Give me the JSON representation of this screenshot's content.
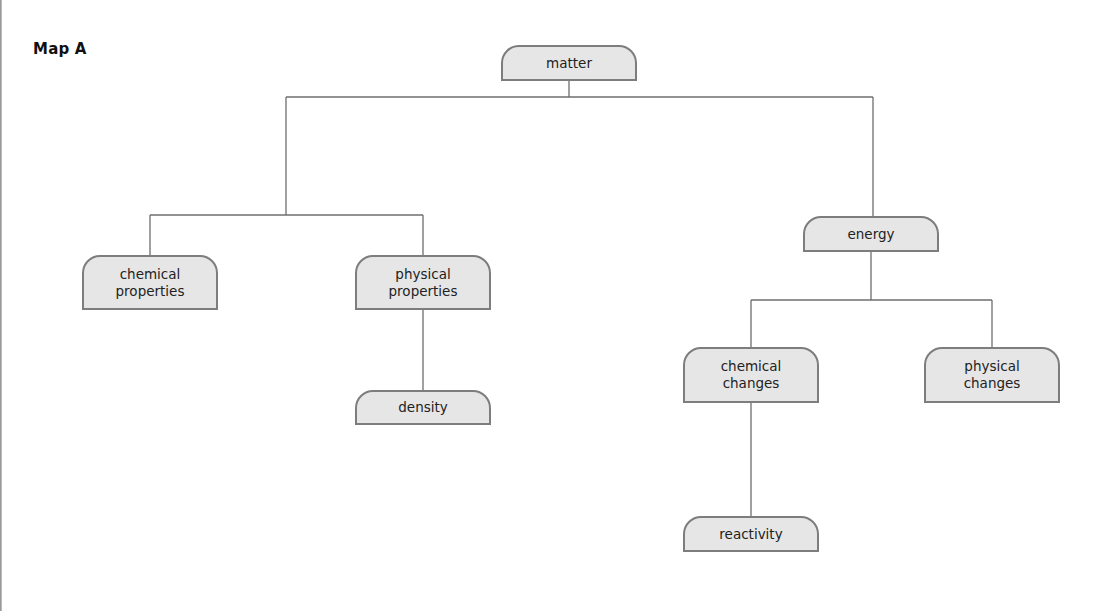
{
  "title": "Map A",
  "colors": {
    "node_fill": "#e6e6e6",
    "node_border": "#7d7d7d",
    "connector": "#6e6e6e",
    "text": "#222222"
  },
  "nodes": {
    "matter": {
      "label": "matter"
    },
    "chemical_properties": {
      "label": "chemical\nproperties"
    },
    "physical_properties": {
      "label": "physical\nproperties"
    },
    "density": {
      "label": "density"
    },
    "energy": {
      "label": "energy"
    },
    "chemical_changes": {
      "label": "chemical\nchanges"
    },
    "physical_changes": {
      "label": "physical\nchanges"
    },
    "reactivity": {
      "label": "reactivity"
    }
  },
  "hierarchy": [
    {
      "parent": "matter",
      "children": [
        "chemical_properties+physical_properties group",
        "energy"
      ]
    },
    {
      "parent": "matter (left branch)",
      "children": [
        "chemical_properties",
        "physical_properties"
      ]
    },
    {
      "parent": "physical_properties",
      "children": [
        "density"
      ]
    },
    {
      "parent": "energy",
      "children": [
        "chemical_changes",
        "physical_changes"
      ]
    },
    {
      "parent": "chemical_changes",
      "children": [
        "reactivity"
      ]
    }
  ]
}
